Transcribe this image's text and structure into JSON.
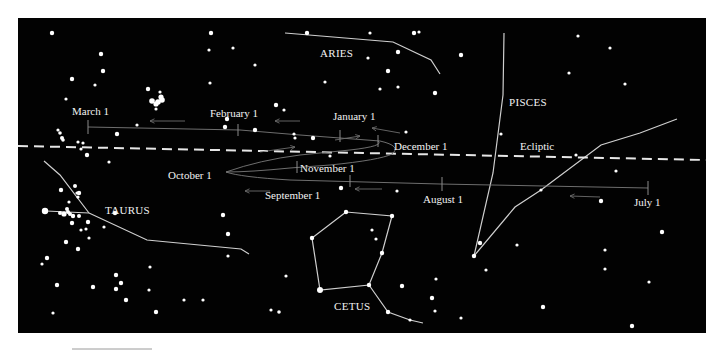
{
  "figure": {
    "panel": {
      "x": 18,
      "y": 18,
      "width": 688,
      "height": 315,
      "background": "#020202"
    },
    "ecliptic": {
      "label": "Ecliptic",
      "label_pos": [
        520,
        150
      ],
      "from": [
        18,
        146
      ],
      "to": [
        706,
        160
      ]
    },
    "constellations": [
      {
        "name": "ARIES",
        "label_pos": [
          320,
          57
        ],
        "lines": [
          [
            [
              285,
              33
            ],
            [
              393,
              42
            ],
            [
              431,
              60
            ],
            [
              440,
              74
            ]
          ]
        ]
      },
      {
        "name": "PISCES",
        "label_pos": [
          509,
          106
        ],
        "lines": [
          [
            [
              504,
              33
            ],
            [
              503,
              95
            ],
            [
              493,
              173
            ],
            [
              474,
              256
            ]
          ],
          [
            [
              474,
              256
            ],
            [
              515,
              207
            ],
            [
              541,
              190
            ],
            [
              601,
              145
            ],
            [
              640,
              133
            ],
            [
              677,
              119
            ]
          ]
        ]
      },
      {
        "name": "TAURUS",
        "label_pos": [
          105,
          214
        ],
        "lines": [
          [
            [
              44,
              161
            ],
            [
              60,
              175
            ],
            [
              89,
              213
            ]
          ],
          [
            [
              46,
              211
            ],
            [
              89,
              213
            ]
          ],
          [
            [
              89,
              213
            ],
            [
              147,
              240
            ],
            [
              241,
              249
            ],
            [
              249,
              254
            ]
          ]
        ]
      },
      {
        "name": "CETUS",
        "label_pos": [
          334,
          310
        ],
        "lines": [
          [
            [
              346,
              212
            ],
            [
              392,
              216
            ],
            [
              382,
              253
            ],
            [
              369,
              285
            ],
            [
              320,
              290
            ],
            [
              312,
              238
            ],
            [
              346,
              212
            ]
          ],
          [
            [
              369,
              285
            ],
            [
              388,
              312
            ],
            [
              410,
              320
            ],
            [
              423,
              323
            ]
          ]
        ]
      }
    ],
    "mars_path": {
      "upper": "M 88 127 L 240 130 L 300 135 L 380 141 Q 402 146 392 154 Q 380 160 330 165 L 290 168 Q 250 172 226 172",
      "inner_loop": "M 226 172 Q 260 160 300 155 L 350 150 Q 385 146 378 141",
      "lower": "M 226 172 Q 240 177 290 180 L 440 184 L 648 188",
      "ticks": [
        {
          "x": 88,
          "y1": 120,
          "y2": 134
        },
        {
          "x": 238,
          "y1": 124,
          "y2": 136
        },
        {
          "x": 340,
          "y1": 130,
          "y2": 142
        },
        {
          "x": 378,
          "y1": 135,
          "y2": 147
        },
        {
          "x": 297,
          "y1": 161,
          "y2": 173
        },
        {
          "x": 350,
          "y1": 175,
          "y2": 187
        },
        {
          "x": 442,
          "y1": 177,
          "y2": 191
        },
        {
          "x": 648,
          "y1": 181,
          "y2": 195
        }
      ],
      "arrows": [
        {
          "from": [
            185,
            121
          ],
          "to": [
            150,
            121
          ]
        },
        {
          "from": [
            300,
            121
          ],
          "to": [
            275,
            121
          ]
        },
        {
          "from": [
            400,
            133
          ],
          "to": [
            372,
            128
          ]
        },
        {
          "from": [
            260,
            152
          ],
          "to": [
            295,
            147
          ]
        },
        {
          "from": [
            335,
            140
          ],
          "to": [
            360,
            136
          ]
        },
        {
          "from": [
            270,
            191
          ],
          "to": [
            245,
            191
          ]
        },
        {
          "from": [
            382,
            189
          ],
          "to": [
            355,
            189
          ]
        },
        {
          "from": [
            600,
            197
          ],
          "to": [
            570,
            196
          ]
        }
      ]
    },
    "date_labels": [
      {
        "text": "March 1",
        "pos": [
          72,
          115
        ]
      },
      {
        "text": "February 1",
        "pos": [
          210,
          117
        ]
      },
      {
        "text": "January 1",
        "pos": [
          333,
          120
        ]
      },
      {
        "text": "December 1",
        "pos": [
          394,
          150
        ]
      },
      {
        "text": "November 1",
        "pos": [
          300,
          172
        ]
      },
      {
        "text": "October 1",
        "pos": [
          168,
          179
        ]
      },
      {
        "text": "September 1",
        "pos": [
          265,
          199
        ]
      },
      {
        "text": "August 1",
        "pos": [
          423,
          203
        ]
      },
      {
        "text": "July 1",
        "pos": [
          634,
          206
        ]
      }
    ],
    "stars": [
      [
        52,
        33,
        2.2
      ],
      [
        101,
        54,
        2.2
      ],
      [
        72,
        79,
        2.2
      ],
      [
        103,
        71,
        2.2
      ],
      [
        95,
        85,
        1.6
      ],
      [
        66,
        99,
        1.6
      ],
      [
        148,
        89,
        2.2
      ],
      [
        160,
        92,
        1.6
      ],
      [
        152,
        101,
        2.8
      ],
      [
        158,
        102,
        2.8
      ],
      [
        162,
        100,
        2.8
      ],
      [
        156,
        104,
        2.6
      ],
      [
        161,
        97,
        2.6
      ],
      [
        156,
        109,
        1.6
      ],
      [
        137,
        125,
        1.6
      ],
      [
        117,
        134,
        2.2
      ],
      [
        87,
        155,
        2.2
      ],
      [
        109,
        162,
        1.6
      ],
      [
        58,
        130,
        1.6
      ],
      [
        60,
        133,
        1.8
      ],
      [
        62,
        138,
        2
      ],
      [
        63,
        140,
        1.8
      ],
      [
        78,
        142,
        1.6
      ],
      [
        83,
        143,
        1.6
      ],
      [
        81,
        149,
        1.6
      ],
      [
        211,
        33,
        2.2
      ],
      [
        209,
        50,
        1.6
      ],
      [
        233,
        48,
        1.6
      ],
      [
        210,
        83,
        1.6
      ],
      [
        227,
        119,
        2.2
      ],
      [
        225,
        127,
        2.2
      ],
      [
        307,
        33,
        2.2
      ],
      [
        370,
        33,
        1.6
      ],
      [
        414,
        33,
        2.2
      ],
      [
        419,
        32,
        1.6
      ],
      [
        461,
        55,
        2.2
      ],
      [
        368,
        58,
        1.6
      ],
      [
        398,
        52,
        2.2
      ],
      [
        388,
        71,
        2.2
      ],
      [
        255,
        65,
        1.6
      ],
      [
        325,
        82,
        1.6
      ],
      [
        380,
        89,
        1.6
      ],
      [
        398,
        87,
        1.6
      ],
      [
        435,
        93,
        2.2
      ],
      [
        276,
        105,
        2.2
      ],
      [
        284,
        110,
        1.6
      ],
      [
        255,
        130,
        2.2
      ],
      [
        294,
        134,
        1.6
      ],
      [
        295,
        138,
        1.6
      ],
      [
        313,
        138,
        2.2
      ],
      [
        406,
        132,
        1.6
      ],
      [
        330,
        156,
        1.6
      ],
      [
        341,
        188,
        2.2
      ],
      [
        397,
        191,
        1.6
      ],
      [
        578,
        36,
        1.6
      ],
      [
        610,
        48,
        1.6
      ],
      [
        569,
        73,
        1.6
      ],
      [
        625,
        84,
        1.6
      ],
      [
        501,
        134,
        1.6
      ],
      [
        576,
        155,
        1.6
      ],
      [
        616,
        171,
        1.6
      ],
      [
        541,
        190,
        1.6
      ],
      [
        601,
        201,
        2.2
      ],
      [
        662,
        232,
        2.2
      ],
      [
        605,
        250,
        1.6
      ],
      [
        605,
        269,
        1.6
      ],
      [
        649,
        282,
        1.6
      ],
      [
        543,
        307,
        2.2
      ],
      [
        632,
        326,
        2.2
      ],
      [
        480,
        243,
        2.2
      ],
      [
        486,
        270,
        1.6
      ],
      [
        517,
        245,
        1.6
      ],
      [
        45,
        211,
        3.2
      ],
      [
        60,
        213,
        2
      ],
      [
        64,
        214,
        2.6
      ],
      [
        67,
        209,
        2
      ],
      [
        68,
        212,
        2
      ],
      [
        70,
        214,
        2
      ],
      [
        73,
        216,
        2.2
      ],
      [
        79,
        216,
        2
      ],
      [
        88,
        222,
        2.2
      ],
      [
        61,
        190,
        2.2
      ],
      [
        75,
        186,
        2
      ],
      [
        79,
        193,
        2.2
      ],
      [
        77,
        193,
        1.6
      ],
      [
        69,
        202,
        1.6
      ],
      [
        78,
        197,
        1.6
      ],
      [
        72,
        223,
        2.2
      ],
      [
        81,
        230,
        1.6
      ],
      [
        86,
        229,
        1.6
      ],
      [
        66,
        242,
        2.2
      ],
      [
        78,
        249,
        2.2
      ],
      [
        89,
        238,
        1.6
      ],
      [
        115,
        213,
        2.2
      ],
      [
        104,
        227,
        1.6
      ],
      [
        47,
        258,
        2.2
      ],
      [
        42,
        264,
        1.6
      ],
      [
        57,
        285,
        2.2
      ],
      [
        93,
        287,
        2.2
      ],
      [
        116,
        275,
        2.2
      ],
      [
        121,
        283,
        2.2
      ],
      [
        116,
        289,
        2.2
      ],
      [
        126,
        300,
        2.2
      ],
      [
        150,
        267,
        1.6
      ],
      [
        149,
        290,
        1.6
      ],
      [
        156,
        312,
        2.2
      ],
      [
        53,
        313,
        1.6
      ],
      [
        223,
        215,
        2.2
      ],
      [
        228,
        234,
        2.2
      ],
      [
        228,
        256,
        1.6
      ],
      [
        184,
        300,
        1.6
      ],
      [
        203,
        300,
        1.6
      ],
      [
        286,
        276,
        1.6
      ],
      [
        271,
        310,
        1.6
      ],
      [
        279,
        312,
        1.8
      ],
      [
        312,
        238,
        2.2
      ],
      [
        320,
        290,
        3
      ],
      [
        346,
        212,
        2.2
      ],
      [
        392,
        216,
        2.2
      ],
      [
        372,
        230,
        1.6
      ],
      [
        376,
        239,
        1.6
      ],
      [
        382,
        253,
        2.2
      ],
      [
        369,
        285,
        2.2
      ],
      [
        388,
        312,
        2.2
      ],
      [
        410,
        320,
        1.6
      ],
      [
        402,
        286,
        2.2
      ],
      [
        436,
        279,
        1.6
      ],
      [
        432,
        298,
        2.2
      ],
      [
        435,
        311,
        1.6
      ],
      [
        461,
        318,
        1.6
      ],
      [
        474,
        256,
        2.2
      ]
    ]
  }
}
